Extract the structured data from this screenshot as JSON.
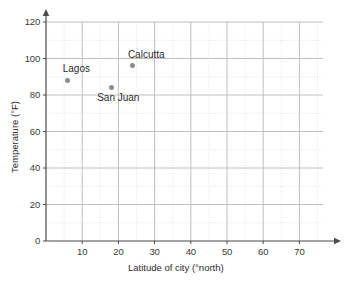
{
  "chart_data": {
    "type": "scatter",
    "title": "",
    "xlabel": "Latitude of city (°north)",
    "ylabel": "Temperature (°F)",
    "xlim": [
      0,
      75
    ],
    "ylim": [
      0,
      125
    ],
    "x_ticks": [
      "10",
      "20",
      "30",
      "40",
      "50",
      "60",
      "70"
    ],
    "x_tick_values": [
      10,
      20,
      30,
      40,
      50,
      60,
      70
    ],
    "y_ticks": [
      "0",
      "20",
      "40",
      "60",
      "80",
      "100",
      "120"
    ],
    "y_tick_values": [
      0,
      20,
      40,
      60,
      80,
      100,
      120
    ],
    "x_major_step": 10,
    "x_minor_step": 5,
    "y_major_step": 20,
    "y_minor_step": 10,
    "grid": true,
    "legend": "none",
    "points": [
      {
        "label": "Lagos",
        "x": 6,
        "y": 88
      },
      {
        "label": "San Juan",
        "x": 18,
        "y": 84
      },
      {
        "label": "Calcutta",
        "x": 24,
        "y": 96
      }
    ],
    "marker_color": "#8c8c8c",
    "major_grid_color": "#b8b8b8",
    "minor_grid_color": "#d8d8d8",
    "axis_color": "#4a4a4a"
  }
}
